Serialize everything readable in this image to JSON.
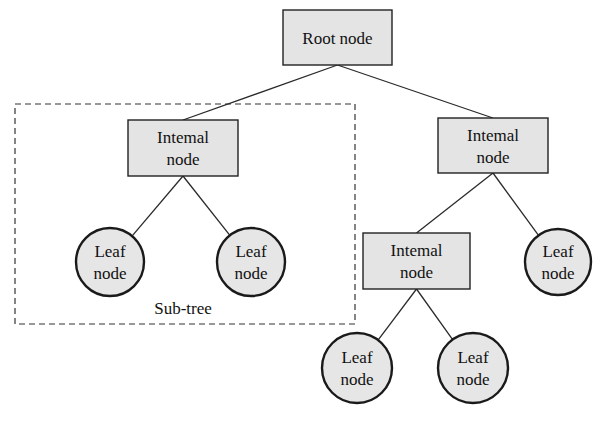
{
  "diagram": {
    "type": "tree",
    "subtree_label": "Sub-tree",
    "nodes": [
      {
        "id": "root",
        "kind": "box",
        "lines": [
          "Root node"
        ]
      },
      {
        "id": "internal-left",
        "kind": "box",
        "lines": [
          "Intemal",
          "node"
        ]
      },
      {
        "id": "internal-right",
        "kind": "box",
        "lines": [
          "Intemal",
          "node"
        ]
      },
      {
        "id": "internal-lower",
        "kind": "box",
        "lines": [
          "Intemal",
          "node"
        ]
      },
      {
        "id": "leaf-1",
        "kind": "leaf",
        "lines": [
          "Leaf",
          "node"
        ]
      },
      {
        "id": "leaf-2",
        "kind": "leaf",
        "lines": [
          "Leaf",
          "node"
        ]
      },
      {
        "id": "leaf-3",
        "kind": "leaf",
        "lines": [
          "Leaf",
          "node"
        ]
      },
      {
        "id": "leaf-4",
        "kind": "leaf",
        "lines": [
          "Leaf",
          "node"
        ]
      },
      {
        "id": "leaf-5",
        "kind": "leaf",
        "lines": [
          "Leaf",
          "node"
        ]
      }
    ],
    "edges": [
      [
        "root",
        "internal-left"
      ],
      [
        "root",
        "internal-right"
      ],
      [
        "internal-left",
        "leaf-1"
      ],
      [
        "internal-left",
        "leaf-2"
      ],
      [
        "internal-right",
        "internal-lower"
      ],
      [
        "internal-right",
        "leaf-3"
      ],
      [
        "internal-lower",
        "leaf-4"
      ],
      [
        "internal-lower",
        "leaf-5"
      ]
    ],
    "subtree_members": [
      "internal-left",
      "leaf-1",
      "leaf-2"
    ]
  }
}
